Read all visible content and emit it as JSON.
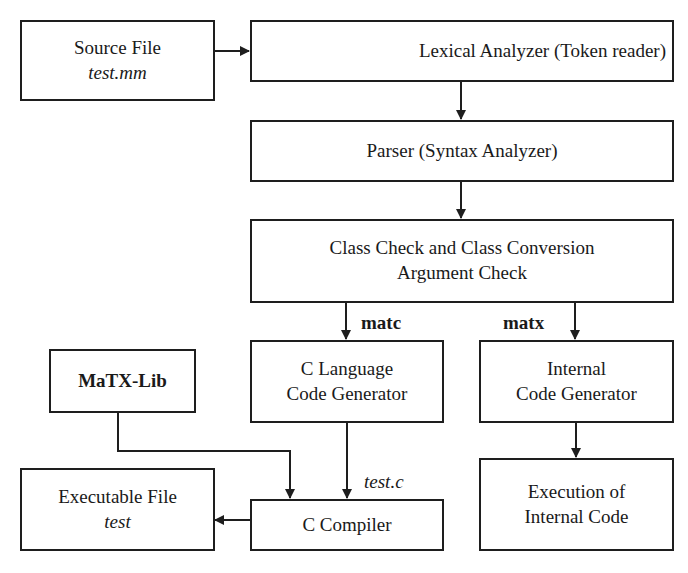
{
  "nodes": {
    "source_file": {
      "line1": "Source File",
      "line2": "test.mm"
    },
    "lexical": {
      "line1": "Lexical Analyzer (Token reader)"
    },
    "parser": {
      "line1": "Parser (Syntax Analyzer)"
    },
    "class_check": {
      "line1": "Class Check and Class Conversion",
      "line2": "Argument Check"
    },
    "c_codegen": {
      "line1": "C Language",
      "line2": "Code Generator"
    },
    "internal_codegen": {
      "line1": "Internal",
      "line2": "Code Generator"
    },
    "matx_lib": {
      "line1": "MaTX-Lib"
    },
    "executable": {
      "line1": "Executable File",
      "line2": "test"
    },
    "c_compiler": {
      "line1": "C Compiler"
    },
    "execution": {
      "line1": "Execution of",
      "line2": "Internal Code"
    }
  },
  "edge_labels": {
    "matc": "matc",
    "matx": "matx",
    "test_c": "test.c"
  },
  "edges": [
    {
      "from": "source_file",
      "to": "lexical"
    },
    {
      "from": "lexical",
      "to": "parser"
    },
    {
      "from": "parser",
      "to": "class_check"
    },
    {
      "from": "class_check",
      "to": "c_codegen",
      "label": "matc"
    },
    {
      "from": "class_check",
      "to": "internal_codegen",
      "label": "matx"
    },
    {
      "from": "c_codegen",
      "to": "c_compiler",
      "label": "test.c"
    },
    {
      "from": "matx_lib",
      "to": "c_compiler"
    },
    {
      "from": "c_compiler",
      "to": "executable"
    },
    {
      "from": "internal_codegen",
      "to": "execution"
    }
  ]
}
